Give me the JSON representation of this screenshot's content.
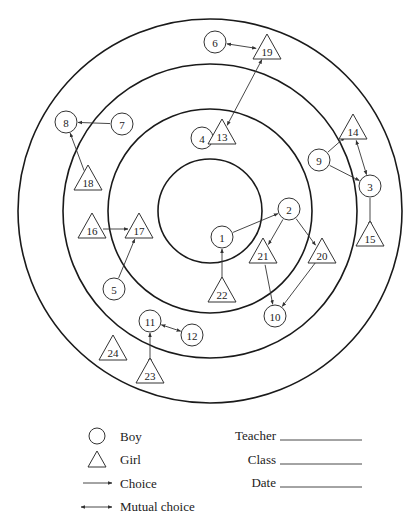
{
  "diagram": {
    "type": "sociogram",
    "center": [
      210,
      211
    ],
    "rings": [
      192,
      147,
      102,
      52
    ],
    "nodes": [
      {
        "id": "1",
        "gender": "boy",
        "x": 222,
        "y": 237
      },
      {
        "id": "2",
        "gender": "boy",
        "x": 289,
        "y": 209
      },
      {
        "id": "3",
        "gender": "boy",
        "x": 370,
        "y": 186
      },
      {
        "id": "4",
        "gender": "boy",
        "x": 202,
        "y": 138
      },
      {
        "id": "5",
        "gender": "boy",
        "x": 114,
        "y": 289
      },
      {
        "id": "6",
        "gender": "boy",
        "x": 215,
        "y": 42
      },
      {
        "id": "7",
        "gender": "boy",
        "x": 122,
        "y": 124
      },
      {
        "id": "8",
        "gender": "boy",
        "x": 66,
        "y": 122
      },
      {
        "id": "9",
        "gender": "boy",
        "x": 319,
        "y": 160
      },
      {
        "id": "10",
        "gender": "boy",
        "x": 275,
        "y": 316
      },
      {
        "id": "11",
        "gender": "boy",
        "x": 150,
        "y": 321
      },
      {
        "id": "12",
        "gender": "boy",
        "x": 192,
        "y": 335
      },
      {
        "id": "13",
        "gender": "girl",
        "x": 222,
        "y": 135
      },
      {
        "id": "14",
        "gender": "girl",
        "x": 353,
        "y": 130
      },
      {
        "id": "15",
        "gender": "girl",
        "x": 370,
        "y": 237
      },
      {
        "id": "16",
        "gender": "girl",
        "x": 92,
        "y": 229
      },
      {
        "id": "17",
        "gender": "girl",
        "x": 139,
        "y": 229
      },
      {
        "id": "18",
        "gender": "girl",
        "x": 88,
        "y": 181
      },
      {
        "id": "19",
        "gender": "girl",
        "x": 267,
        "y": 50
      },
      {
        "id": "20",
        "gender": "girl",
        "x": 322,
        "y": 254
      },
      {
        "id": "21",
        "gender": "girl",
        "x": 263,
        "y": 254
      },
      {
        "id": "22",
        "gender": "girl",
        "x": 222,
        "y": 293
      },
      {
        "id": "23",
        "gender": "girl",
        "x": 150,
        "y": 374
      },
      {
        "id": "24",
        "gender": "girl",
        "x": 113,
        "y": 351
      }
    ],
    "edges": [
      {
        "from": "7",
        "to": "8",
        "type": "choice"
      },
      {
        "from": "18",
        "to": "8",
        "type": "choice"
      },
      {
        "from": "6",
        "to": "19",
        "type": "mutual"
      },
      {
        "from": "13",
        "to": "19",
        "type": "mutual"
      },
      {
        "from": "4",
        "to": "13",
        "type": "mutual"
      },
      {
        "from": "9",
        "to": "14",
        "type": "choice"
      },
      {
        "from": "14",
        "to": "3",
        "type": "mutual"
      },
      {
        "from": "9",
        "to": "3",
        "type": "choice"
      },
      {
        "from": "3",
        "to": "15",
        "type": "choice"
      },
      {
        "from": "1",
        "to": "2",
        "type": "choice"
      },
      {
        "from": "2",
        "to": "21",
        "type": "choice"
      },
      {
        "from": "2",
        "to": "20",
        "type": "choice"
      },
      {
        "from": "21",
        "to": "10",
        "type": "choice"
      },
      {
        "from": "20",
        "to": "10",
        "type": "choice"
      },
      {
        "from": "22",
        "to": "1",
        "type": "choice"
      },
      {
        "from": "16",
        "to": "17",
        "type": "choice"
      },
      {
        "from": "5",
        "to": "17",
        "type": "choice"
      },
      {
        "from": "11",
        "to": "12",
        "type": "mutual"
      },
      {
        "from": "11",
        "to": "23",
        "type": "mutual"
      }
    ]
  },
  "legend": {
    "boy": "Boy",
    "girl": "Girl",
    "choice": "Choice",
    "mutual": "Mutual choice"
  },
  "form": {
    "teacher_label": "Teacher",
    "class_label": "Class",
    "date_label": "Date",
    "teacher_value": "",
    "class_value": "",
    "date_value": ""
  }
}
